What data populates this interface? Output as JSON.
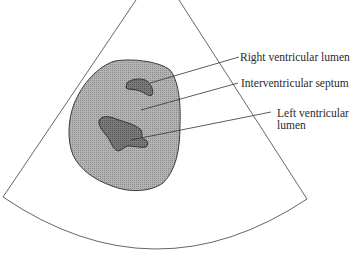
{
  "diagram": {
    "type": "echocardiogram-schematic",
    "view": "parasternal short-axis sector scan",
    "colors": {
      "sector_outline": "#555555",
      "myocardium_fill": "#a8a8a8",
      "myocardium_outline": "#3a3a3a",
      "lumen_fill": "#6e6e6e",
      "leader_line": "#333333",
      "label_text": "#2a2a2a"
    },
    "labels": {
      "right_ventricular_lumen": "Right ventricular lumen",
      "interventricular_septum": "Interventricular septum",
      "left_ventricular_lumen_line1": "Left ventricular",
      "left_ventricular_lumen_line2": "lumen"
    }
  }
}
